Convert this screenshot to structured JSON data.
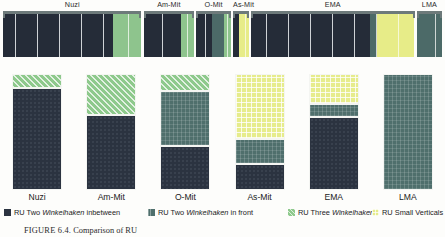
{
  "figure": {
    "caption_label": "FIGURE 6.4.",
    "caption_text": "Comparison of RU"
  },
  "top_strip": {
    "groups": [
      {
        "label": "Nuzi",
        "cells": [
          "dark",
          "dark",
          "dark",
          "dark",
          "dark",
          "dark",
          "dark",
          "dark",
          "dark",
          "dark",
          "dark",
          "dark",
          "dark",
          "dark",
          "dark",
          "dark",
          "dark",
          "dark",
          "dark",
          "dark",
          "dark",
          "dark",
          "dark",
          "dark",
          "dark",
          "dark",
          "dark",
          "dark",
          "dark",
          "dark",
          "dark",
          "dark",
          "dark",
          "dark",
          "dark",
          "green",
          "green",
          "green",
          "green",
          "green",
          "green",
          "green",
          "green",
          "green"
        ]
      },
      {
        "label": "Am-Mit",
        "cells": [
          "dark",
          "dark",
          "dark",
          "dark",
          "dark",
          "dark",
          "dark",
          "dark",
          "dark",
          "dark",
          "dark",
          "dark",
          "green",
          "green",
          "green",
          "green"
        ]
      },
      {
        "label": "O-Mit",
        "cells": [
          "dark",
          "dark",
          "dark",
          "dark",
          "dark",
          "teal",
          "teal",
          "teal",
          "teal",
          "green",
          "green"
        ]
      },
      {
        "label": "As-Mit",
        "cells": [
          "dark",
          "dark",
          "yellow",
          "yellow",
          "yellow"
        ]
      },
      {
        "label": "EMA",
        "cells": [
          "dark",
          "dark",
          "dark",
          "dark",
          "dark",
          "dark",
          "dark",
          "dark",
          "dark",
          "dark",
          "dark",
          "dark",
          "dark",
          "dark",
          "dark",
          "dark",
          "dark",
          "dark",
          "dark",
          "dark",
          "dark",
          "dark",
          "dark",
          "dark",
          "dark",
          "dark",
          "dark",
          "dark",
          "dark",
          "dark",
          "dark",
          "dark",
          "dark",
          "dark",
          "dark",
          "dark",
          "dark",
          "dark",
          "teal",
          "teal",
          "yellow",
          "yellow",
          "yellow",
          "yellow",
          "yellow",
          "yellow",
          "yellow",
          "yellow",
          "yellow",
          "yellow",
          "yellow",
          "yellow"
        ]
      },
      {
        "label": "LMA",
        "cells": [
          "teal",
          "teal",
          "teal",
          "teal",
          "teal",
          "teal",
          "teal",
          "teal"
        ]
      }
    ]
  },
  "legend": {
    "items": [
      {
        "id": "ru-two-winkelhaken-inbetween",
        "swatch": "dark",
        "pre": "RU Two ",
        "em": "Winkelhaken",
        "post": " inbetween"
      },
      {
        "id": "ru-two-winkelhaken-in-front",
        "swatch": "teal",
        "pre": "RU Two ",
        "em": "Winkelhaken",
        "post": " in front"
      },
      {
        "id": "ru-three-winkelhaken",
        "swatch": "green",
        "pre": "RU Three ",
        "em": "Winkelhaken",
        "post": ""
      },
      {
        "id": "ru-small-verticals",
        "swatch": "yellow",
        "pre": "RU Small Verticals",
        "em": "",
        "post": ""
      }
    ]
  },
  "chart_data": {
    "type": "bar",
    "stacked": true,
    "normalized_percent": true,
    "title": "",
    "xlabel": "",
    "ylabel": "",
    "ylim": [
      0,
      100
    ],
    "grid": false,
    "legend_position": "bottom",
    "categories": [
      "Nuzi",
      "Am-Mit",
      "O-Mit",
      "As-Mit",
      "EMA",
      "LMA"
    ],
    "series": [
      {
        "name": "RU Two Winkelhaken inbetween",
        "pattern": "dark",
        "color": "#2b3340",
        "values": [
          88,
          65,
          38,
          22,
          63,
          0
        ]
      },
      {
        "name": "RU Two Winkelhaken in front",
        "pattern": "teal",
        "color": "#4f6f6c",
        "values": [
          0,
          0,
          47,
          22,
          11,
          100
        ]
      },
      {
        "name": "RU Three Winkelhaken",
        "pattern": "green",
        "color": "#8ec98c",
        "values": [
          12,
          35,
          15,
          0,
          0,
          0
        ]
      },
      {
        "name": "RU Small Verticals",
        "pattern": "yellow",
        "color": "#e6ec8c",
        "values": [
          0,
          0,
          0,
          56,
          26,
          0
        ]
      }
    ]
  }
}
